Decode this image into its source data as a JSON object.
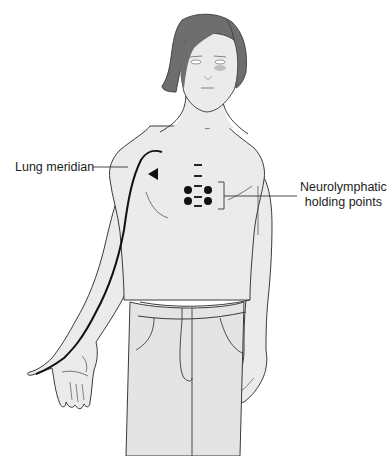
{
  "figure": {
    "colors": {
      "skin": "#ebebeb",
      "hair": "#6e6e6e",
      "outline": "#3a3a3a",
      "meridian": "#111111",
      "points": "#111111",
      "background": "#ffffff"
    }
  },
  "labels": {
    "lung_meridian": "Lung meridian",
    "neurolymphatic_line1": "Neurolymphatic",
    "neurolymphatic_line2": "holding points"
  },
  "markers": {
    "meridian_direction": "arrowhead pointing left near right shoulder",
    "holding_points_count": 4,
    "dash_marks_count": 4
  }
}
